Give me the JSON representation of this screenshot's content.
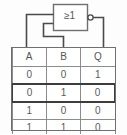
{
  "circuit": {
    "gate": {
      "symbol": "≥1",
      "type": "nor-gate",
      "has_inversion_bubble": true,
      "input_count": 2
    },
    "wire_color": "#4a4a4a",
    "outline_color": "#6f6f6f"
  },
  "truth_table": {
    "headers": [
      "A",
      "B",
      "Q"
    ],
    "rows": [
      {
        "cells": [
          "0",
          "0",
          "1"
        ],
        "highlighted": false
      },
      {
        "cells": [
          "0",
          "1",
          "0"
        ],
        "highlighted": true
      },
      {
        "cells": [
          "1",
          "0",
          "0"
        ],
        "highlighted": false
      },
      {
        "cells": [
          "1",
          "1",
          "0"
        ],
        "highlighted": false
      }
    ],
    "border_color": "#8c8c8c",
    "highlight_color": "#3d3d3d",
    "text_color": "#5a5a5a"
  }
}
